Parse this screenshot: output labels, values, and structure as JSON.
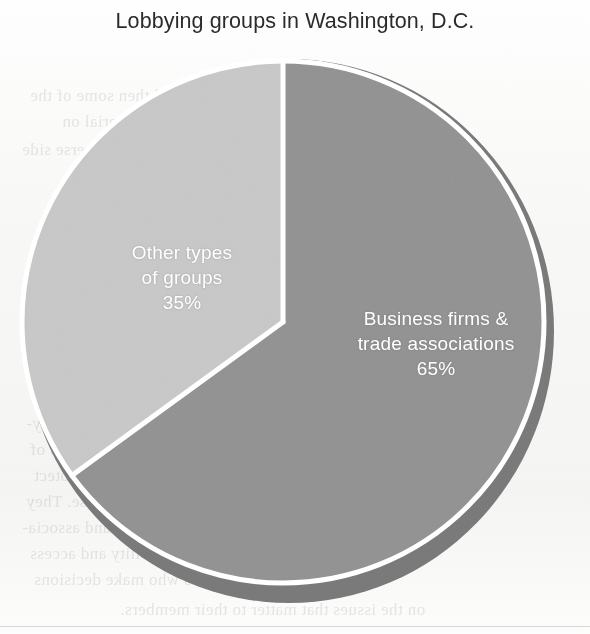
{
  "chart_data": {
    "type": "pie",
    "title": "Lobbying groups in Washington, D.C.",
    "categories": [
      "Business firms & trade associations",
      "Other types of groups"
    ],
    "values": [
      65,
      35
    ],
    "unit": "%",
    "labels": [
      {
        "name": "Business firms & trade associations",
        "line1": "Business firms &",
        "line2": "trade associations",
        "value": 65,
        "value_label": "65%",
        "color": "#919191",
        "text_color": "#ffffff"
      },
      {
        "name": "Other types of groups",
        "line1": "Other types",
        "line2": "of groups",
        "value": 35,
        "value_label": "35%",
        "color": "#c8c8c8",
        "text_color": "#ffffff"
      }
    ],
    "start_angle_deg": 0,
    "direction": "clockwise",
    "legend": "none",
    "grid": false,
    "style": {
      "slice_separator_color": "#ffffff",
      "shadow_color": "#7a7a7a",
      "background": "#ffffff"
    }
  },
  "figure": {
    "title": "Lobbying groups in Washington, D.C."
  },
  "bleed_text": {
    "lines": [
      "and then some of the",
      "other material on",
      "the reverse side",
      "have roughly 12,000 registered lobby-",
      "ists, a somewhat informally of support-",
      "ing groups and information are required to",
      "register and disclose their spending.",
      "Many interest groups devote much of their lobby-",
      "ing efforts to monitoring the activities of",
      "federal agencies and the Congress to protect",
      "and do not have a general purpose. They",
      "represent the private sector, unions, and associa-",
      "tions to maintain their visibility and access",
      "to the policymakers who make decisions",
      "on the issues that matter to their members."
    ]
  }
}
